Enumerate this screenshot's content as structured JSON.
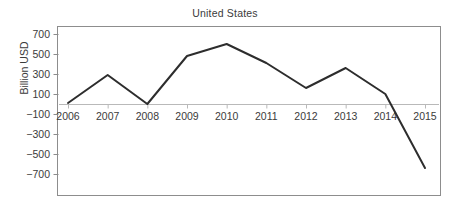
{
  "chart_data": {
    "type": "line",
    "title": "United States",
    "xlabel": "",
    "ylabel": "Billion USD",
    "x": [
      2006,
      2007,
      2008,
      2009,
      2010,
      2011,
      2012,
      2013,
      2014,
      2015
    ],
    "categories": [
      "2006",
      "2007",
      "2008",
      "2009",
      "2010",
      "2011",
      "2012",
      "2013",
      "2014",
      "2015"
    ],
    "values": [
      10,
      290,
      0,
      480,
      600,
      410,
      160,
      360,
      100,
      -640
    ],
    "series": [
      {
        "name": "United States",
        "values": [
          10,
          290,
          0,
          480,
          600,
          410,
          160,
          360,
          100,
          -640
        ],
        "color": "#2d2d2d"
      }
    ],
    "ylim": [
      -800,
      800
    ],
    "yticks": [
      700,
      500,
      300,
      100,
      -100,
      -300,
      -500,
      -700
    ],
    "ytick_labels": [
      "700",
      "500",
      "300",
      "100",
      "−100",
      "−300",
      "−500",
      "−700"
    ],
    "xtick_labels": [
      "2006",
      "2007",
      "2008",
      "2009",
      "2010",
      "2011",
      "2012",
      "2013",
      "2014",
      "2015"
    ],
    "grid": false,
    "zero_line": true,
    "legend": "none",
    "line_color": "#2d2d2d",
    "frame_color": "#8d8d8d",
    "axis_color": "#b9b9b9"
  }
}
